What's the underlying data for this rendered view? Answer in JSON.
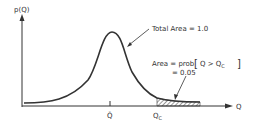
{
  "diagram": {
    "type": "probability-density-curve",
    "y_axis_label": "p(Q)",
    "x_axis_label": "Q",
    "mean_label": "Q̄",
    "critical_label": "Q",
    "critical_subscript": "C",
    "total_area_label": "Total Area = 1.0",
    "area_label_line1_prefix": "Area = prob",
    "area_label_bracket_content": "Q > Q",
    "area_label_bracket_subscript": "C",
    "area_label_line2": "= 0.05",
    "colors": {
      "ink": "#333333",
      "background": "#ffffff"
    }
  }
}
